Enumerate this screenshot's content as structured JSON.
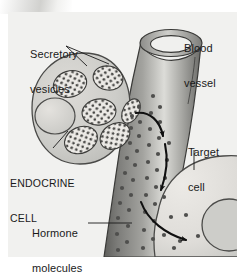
{
  "figure": {
    "background_color": "#f1f1ef",
    "ink_color": "#1a1a1a"
  },
  "labels": {
    "secretory_vesicles": {
      "line1": "Secretory",
      "line2": "vesicles",
      "name": "secretory-vesicles-label"
    },
    "blood_vessel": {
      "line1": "Blood",
      "line2": "vessel",
      "name": "blood-vessel-label"
    },
    "endocrine_cell": {
      "line1": "ENDOCRINE",
      "line2": "CELL",
      "name": "endocrine-cell-label"
    },
    "target_cell": {
      "line1": "Target",
      "line2": "cell",
      "name": "target-cell-label"
    },
    "hormone_molecules": {
      "line1": "Hormone",
      "line2": "molecules",
      "name": "hormone-molecules-label"
    }
  },
  "structures": {
    "endocrine_cell": {
      "fill": "#cfcfcc",
      "stroke": "#4a4a48",
      "nucleus_fill": "#dedcd8",
      "vesicle_count": 6,
      "vesicle_fill": "#e6e5e1",
      "stipple_color": "#3b3b39"
    },
    "blood_vessel": {
      "wall_dark": "#6f6f6c",
      "wall_light": "#d6d6d2",
      "lumen_fill": "#f0f0ee",
      "stroke": "#3a3a38"
    },
    "target_cell": {
      "fill": "#e3e3df",
      "stroke": "#4a4a48",
      "nucleus_fill": "#cdcdc9"
    },
    "hormone_dot": {
      "color": "#4f4f4d",
      "radius": 2.1
    },
    "arrows": {
      "color": "#101010",
      "count": 3
    }
  }
}
